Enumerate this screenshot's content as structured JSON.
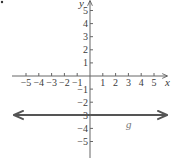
{
  "chart_data": {
    "type": "line",
    "title": "",
    "xlabel": "x",
    "ylabel": "y",
    "xlim": [
      -5,
      5
    ],
    "ylim": [
      -5,
      5
    ],
    "x_ticks": [
      -5,
      -4,
      -3,
      -2,
      -1,
      1,
      2,
      3,
      4,
      5
    ],
    "y_ticks": [
      5,
      4,
      3,
      2,
      1,
      -1,
      -2,
      -3,
      -4,
      -5
    ],
    "x_tick_labels": [
      "−5",
      "−4",
      "−3",
      "−2",
      "−1",
      "1",
      "2",
      "3",
      "4",
      "5"
    ],
    "y_tick_labels": [
      "5",
      "4",
      "3",
      "2",
      "1",
      "−1",
      "−2",
      "−3",
      "−4",
      "−5"
    ],
    "grid": false,
    "series": [
      {
        "name": "g",
        "equation": "y = -3",
        "x": [
          -6,
          6
        ],
        "y": [
          -3,
          -3
        ],
        "arrows": "both",
        "color": "#555555"
      }
    ],
    "annotations": [
      {
        "text": "g",
        "x": 3,
        "y": -3.7
      }
    ]
  },
  "labels": {
    "x_axis": "x",
    "y_axis": "y",
    "line": "g"
  }
}
